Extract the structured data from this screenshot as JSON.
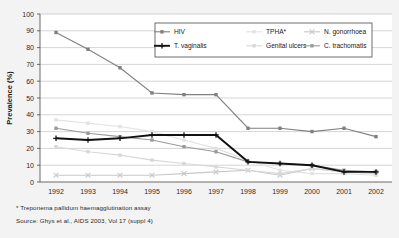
{
  "figure": {
    "background_color": "#f3f3f3",
    "plot_background_color": "#ffffff"
  },
  "axis": {
    "ylabel": "Prevalence (%)",
    "ytick_labels": [
      "0",
      "10",
      "20",
      "30",
      "40",
      "50",
      "60",
      "70",
      "80",
      "90",
      "100"
    ],
    "xtick_labels": [
      "1992",
      "1993",
      "1994",
      "1995",
      "1996",
      "1997",
      "1998",
      "1999",
      "2000",
      "2001",
      "2002"
    ]
  },
  "legend": {
    "entries": [
      {
        "label": "HIV",
        "color": "#808080"
      },
      {
        "label": "TPHA*",
        "color": "#e2e2e2"
      },
      {
        "label": "N. gonorrhoea",
        "color": "#c9c9c9"
      },
      {
        "label": "T. vaginalis",
        "color": "#111111"
      },
      {
        "label": "Genital ulcers",
        "color": "#d8d8d8"
      },
      {
        "label": "C. trachomatis",
        "color": "#9a9a9a"
      }
    ]
  },
  "footnotes": {
    "tpha": "* Treponema pallidum haemagglutination assay",
    "source": "Source: Ghys et al., AIDS 2003, Vol 17 (suppl 4)"
  },
  "chart_data": {
    "type": "line",
    "title": "",
    "xlabel": "",
    "ylabel": "Prevalence (%)",
    "ylim": [
      0,
      100
    ],
    "ytick_step": 10,
    "grid": true,
    "legend_position": "top-right-inside",
    "categories": [
      "1992",
      "1993",
      "1994",
      "1995",
      "1996",
      "1997",
      "1998",
      "1999",
      "2000",
      "2001",
      "2002"
    ],
    "series": [
      {
        "name": "HIV",
        "color": "#808080",
        "marker": "square",
        "values": [
          89,
          79,
          68,
          53,
          52,
          52,
          32,
          32,
          30,
          32,
          27
        ]
      },
      {
        "name": "TPHA*",
        "color": "#e2e2e2",
        "marker": "square",
        "values": [
          37,
          35,
          33,
          30,
          25,
          20,
          13,
          7,
          5,
          5,
          4
        ]
      },
      {
        "name": "N. gonorrhoea",
        "color": "#c9c9c9",
        "marker": "cross",
        "values": [
          4,
          4,
          4,
          4,
          5,
          6,
          7,
          4,
          8,
          6,
          6
        ]
      },
      {
        "name": "T. vaginalis",
        "color": "#111111",
        "marker": "plus",
        "values": [
          26,
          25,
          26,
          28,
          28,
          28,
          12,
          11,
          10,
          6,
          6
        ]
      },
      {
        "name": "Genital ulcers",
        "color": "#d8d8d8",
        "marker": "square",
        "values": [
          21,
          18,
          16,
          13,
          11,
          9,
          7,
          5,
          8,
          6,
          5
        ]
      },
      {
        "name": "C. trachomatis",
        "color": "#9a9a9a",
        "marker": "square",
        "values": [
          32,
          29,
          27,
          25,
          21,
          18,
          12,
          11,
          10,
          7,
          6
        ]
      }
    ]
  }
}
